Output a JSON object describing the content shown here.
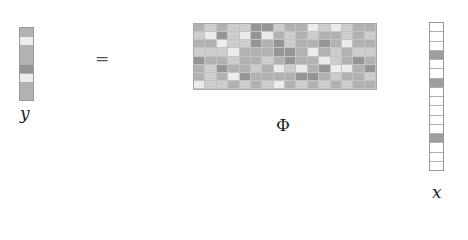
{
  "equation": {
    "lhs_label": "y",
    "equals": "=",
    "matrix_label": "Φ",
    "rhs_label": "x"
  },
  "palette": {
    "0": "#ececec",
    "1": "#cdcdcd",
    "2": "#b2b2b2",
    "3": "#959595",
    "x_nonzero": "#9e9e9e",
    "x_zero": "#ffffff"
  },
  "y_vector": {
    "length": 8,
    "shades": [
      2,
      0,
      2,
      2,
      3,
      0,
      2,
      2
    ]
  },
  "phi_matrix": {
    "rows": 8,
    "cols": 16,
    "shades": [
      [
        2,
        1,
        2,
        1,
        1,
        3,
        3,
        1,
        2,
        2,
        0,
        1,
        0,
        1,
        2,
        2
      ],
      [
        1,
        0,
        3,
        1,
        0,
        3,
        0,
        2,
        1,
        2,
        1,
        2,
        2,
        1,
        2,
        1
      ],
      [
        2,
        2,
        0,
        1,
        1,
        3,
        2,
        3,
        1,
        2,
        2,
        3,
        2,
        0,
        2,
        2
      ],
      [
        1,
        1,
        1,
        0,
        2,
        2,
        2,
        3,
        3,
        2,
        0,
        2,
        1,
        2,
        1,
        1
      ],
      [
        3,
        2,
        2,
        1,
        2,
        2,
        1,
        2,
        3,
        2,
        2,
        0,
        1,
        2,
        3,
        2
      ],
      [
        2,
        1,
        3,
        2,
        2,
        1,
        2,
        0,
        1,
        0,
        2,
        3,
        0,
        0,
        2,
        3
      ],
      [
        2,
        1,
        2,
        0,
        3,
        2,
        2,
        2,
        2,
        3,
        3,
        2,
        1,
        2,
        2,
        1
      ],
      [
        0,
        1,
        1,
        2,
        1,
        2,
        1,
        0,
        2,
        1,
        2,
        1,
        2,
        1,
        2,
        2
      ]
    ]
  },
  "x_vector": {
    "length": 16,
    "nonzero_indices": [
      3,
      6,
      12
    ]
  }
}
